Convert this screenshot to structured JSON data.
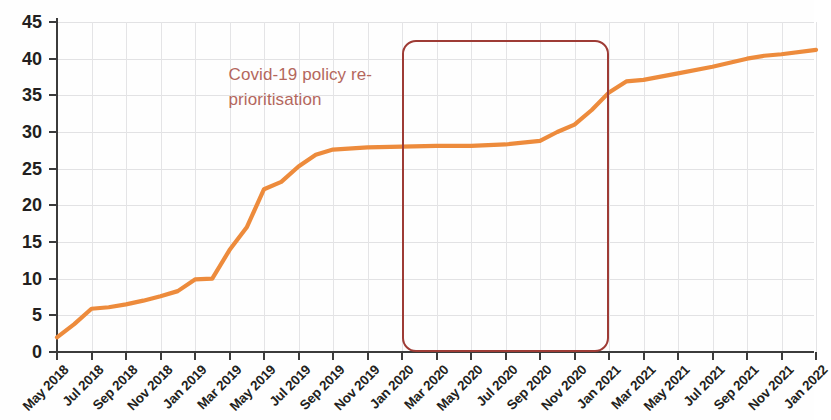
{
  "chart_data": {
    "type": "line",
    "title": "",
    "subtitle": "",
    "xlabel": "",
    "ylabel": "",
    "ylim": [
      0,
      45
    ],
    "ytick_step": 5,
    "grid": true,
    "legend": null,
    "legend_position": "none",
    "series_color": "#ED8B3C",
    "yticks": [
      "0",
      "5",
      "10",
      "15",
      "20",
      "25",
      "30",
      "35",
      "40",
      "45"
    ],
    "categories": [
      "May 2018",
      "Jul 2018",
      "Sep 2018",
      "Nov 2018",
      "Jan 2019",
      "Mar 2019",
      "May 2019",
      "Jul 2019",
      "Sep 2019",
      "Nov 2019",
      "Jan 2020",
      "Mar 2020",
      "May 2020",
      "Jul 2020",
      "Sep 2020",
      "Nov 2020",
      "Jan 2021",
      "Mar 2021",
      "May 2021",
      "Jul 2021",
      "Sep 2021",
      "Nov 2021",
      "Jan 2022"
    ],
    "series": [
      {
        "name": "Cumulative count",
        "color": "#ED8B3C",
        "x": [
          "May 2018",
          "Jun 2018",
          "Jul 2018",
          "Aug 2018",
          "Sep 2018",
          "Oct 2018",
          "Nov 2018",
          "Dec 2018",
          "Jan 2019",
          "Feb 2019",
          "Mar 2019",
          "Apr 2019",
          "May 2019",
          "Jun 2019",
          "Jul 2019",
          "Aug 2019",
          "Sep 2019",
          "Nov 2019",
          "Jan 2020",
          "Mar 2020",
          "May 2020",
          "Jul 2020",
          "Sep 2020",
          "Oct 2020",
          "Nov 2020",
          "Dec 2020",
          "Jan 2021",
          "Feb 2021",
          "Mar 2021",
          "May 2021",
          "Jul 2021",
          "Sep 2021",
          "Oct 2021",
          "Nov 2021",
          "Jan 2022"
        ],
        "values": [
          2.0,
          3.8,
          5.9,
          6.1,
          6.5,
          7.0,
          7.6,
          8.3,
          9.9,
          10.0,
          13.9,
          17.0,
          22.2,
          23.2,
          25.3,
          26.9,
          27.6,
          27.9,
          28.0,
          28.1,
          28.1,
          28.3,
          28.8,
          30.0,
          31.0,
          33.0,
          35.4,
          36.9,
          37.1,
          38.0,
          38.9,
          40.0,
          40.4,
          40.6,
          41.2
        ]
      }
    ],
    "annotations": [
      {
        "text": "Covid-19 policy re-\nprioritisation",
        "color": "#b4675d",
        "x": "Jul 2019",
        "y": 38
      }
    ],
    "highlight_regions": [
      {
        "label": "Covid-19 policy re-prioritisation period",
        "from": "Jan 2020",
        "to": "Jan 2021",
        "y_from": 0,
        "y_to": 42.5,
        "border_color": "#9e3b35",
        "shape": "rounded-rectangle"
      }
    ]
  }
}
